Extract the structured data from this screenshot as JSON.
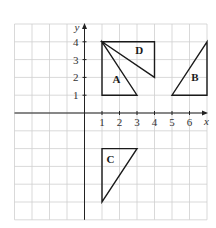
{
  "diagram": {
    "type": "coordinate-grid",
    "grid": {
      "x_min": -4,
      "x_max": 7,
      "y_min": -6,
      "y_max": 5,
      "grid_color": "#cfcfcf"
    },
    "axes": {
      "x_label": "x",
      "y_label": "y",
      "x_ticks": [
        "1",
        "2",
        "3",
        "4",
        "5",
        "6"
      ],
      "y_ticks": [
        "1",
        "2",
        "3",
        "4"
      ]
    },
    "shapes": [
      {
        "label": "A",
        "vertices": [
          [
            1,
            4
          ],
          [
            1,
            1
          ],
          [
            3,
            1
          ]
        ],
        "label_pos": [
          1.6,
          1.7
        ]
      },
      {
        "label": "B",
        "vertices": [
          [
            5,
            1
          ],
          [
            7,
            1
          ],
          [
            7,
            4
          ]
        ],
        "label_pos": [
          6.1,
          1.8
        ]
      },
      {
        "label": "C",
        "vertices": [
          [
            1,
            -2
          ],
          [
            3,
            -2
          ],
          [
            1,
            -5
          ]
        ],
        "label_pos": [
          1.25,
          -2.8
        ]
      },
      {
        "label": "D",
        "vertices": [
          [
            1,
            4
          ],
          [
            4,
            4
          ],
          [
            4,
            2
          ]
        ],
        "label_pos": [
          2.9,
          3.3
        ]
      }
    ]
  }
}
